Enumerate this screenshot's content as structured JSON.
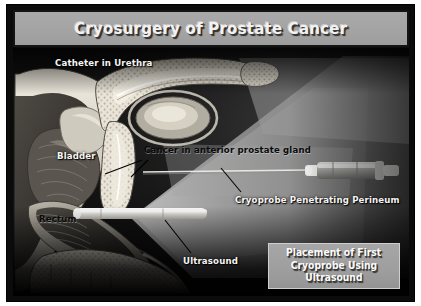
{
  "slide": {
    "title": "Cryosurgery of Prostate Cancer",
    "frame_color": "#0b0b0b",
    "title_bar_color": "#a4a4a4",
    "title_text_color": "#f2f2f2",
    "background_color": "#ffffff"
  },
  "illustration": {
    "kind": "medical-sagittal-cross-section",
    "subject": "male pelvis, prostate cryosurgery with transrectal ultrasound guidance",
    "background_color": "#141414",
    "ultrasound_fan_color": "#8e8e8e",
    "tissue_light_color": "#e8e4da",
    "tissue_mid_color": "#9d9a92",
    "tissue_dark_color": "#4a4641",
    "probe_color": "#f3f3ef"
  },
  "labels": [
    {
      "id": "catheter",
      "text": "Catheter in Urethra",
      "style": "light"
    },
    {
      "id": "bladder",
      "text": "Bladder",
      "style": "light"
    },
    {
      "id": "cancer",
      "text": "Cancer in anterior prostate gland",
      "style": "dark"
    },
    {
      "id": "rectum",
      "text": "Rectum",
      "style": "dark"
    },
    {
      "id": "cryoprobe",
      "text": "Cryoprobe Penetrating Perineum",
      "style": "light"
    },
    {
      "id": "ultrasound",
      "text": "Ultrasound",
      "style": "light"
    }
  ],
  "caption": {
    "lines": [
      "Placement of First",
      "Cryoprobe Using",
      "Ultrasound"
    ],
    "box_color": "#9e9e9e",
    "text_color": "#fbfbfb"
  }
}
